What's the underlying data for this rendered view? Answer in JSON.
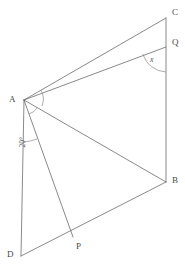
{
  "figure": {
    "kind": "plane-geometry-diagram",
    "canvas": {
      "width": 185,
      "height": 267,
      "background": "#ffffff"
    },
    "stroke_color": "#6b6b6b",
    "label_color": "#4a4a4a",
    "points": [
      {
        "id": "A",
        "label": "A",
        "x": 24,
        "y": 100,
        "label_x": 9,
        "label_y": 95
      },
      {
        "id": "B",
        "label": "B",
        "x": 166,
        "y": 182,
        "label_x": 172,
        "label_y": 180
      },
      {
        "id": "C",
        "label": "C",
        "x": 166,
        "y": 18,
        "label_x": 172,
        "label_y": 10
      },
      {
        "id": "D",
        "label": "D",
        "x": 21,
        "y": 256,
        "label_x": 8,
        "label_y": 252
      },
      {
        "id": "P",
        "label": "P",
        "x": 73,
        "y": 237,
        "label_x": 76,
        "label_y": 244
      },
      {
        "id": "Q",
        "label": "Q",
        "x": 166,
        "y": 47,
        "label_x": 172,
        "label_y": 40
      }
    ],
    "segments": [
      {
        "name": "segment-A-C",
        "from": "A",
        "to": "C"
      },
      {
        "name": "segment-A-Q",
        "from": "A",
        "to": "Q"
      },
      {
        "name": "segment-A-B",
        "from": "A",
        "to": "B"
      },
      {
        "name": "segment-A-P",
        "from": "A",
        "to": "P"
      },
      {
        "name": "segment-A-D",
        "from": "A",
        "to": "D"
      },
      {
        "name": "segment-C-B",
        "from": "C",
        "to": "B"
      },
      {
        "name": "segment-D-B",
        "from": "D",
        "to": "B"
      }
    ],
    "angles": [
      {
        "name": "angle-at-A-between-AD-and-AP",
        "label": "20°",
        "vertex": "A",
        "label_x": 25,
        "label_y": 158,
        "rotated": true
      },
      {
        "name": "angle-at-Q-between-QA-and-QB",
        "label": "x",
        "vertex": "Q",
        "label_x": 151,
        "label_y": 58,
        "rotated": false
      }
    ]
  }
}
